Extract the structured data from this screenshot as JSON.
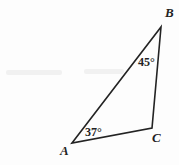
{
  "figure": {
    "type": "geometry-diagram",
    "shape": "triangle",
    "canvas": {
      "width": 179,
      "height": 165
    },
    "background_color": "#fdfdfd",
    "stroke_color": "#232323",
    "stroke_width": 1.6,
    "vertices": [
      {
        "name": "A",
        "label": "A",
        "x": 72,
        "y": 143
      },
      {
        "name": "B",
        "label": "B",
        "x": 161,
        "y": 27
      },
      {
        "name": "C",
        "label": "C",
        "x": 152,
        "y": 128
      }
    ],
    "sides": [
      {
        "name": "AB",
        "from": "A",
        "to": "B"
      },
      {
        "name": "BC",
        "from": "B",
        "to": "C"
      },
      {
        "name": "AC",
        "from": "A",
        "to": "C"
      }
    ],
    "angles": [
      {
        "at": "A",
        "label": "37°",
        "value": 37,
        "unit": "degrees"
      },
      {
        "at": "B",
        "label": "45°",
        "value": 45,
        "unit": "degrees"
      },
      {
        "at": "C",
        "label": "",
        "value": null,
        "unit": "degrees"
      }
    ],
    "polygon_points": "72,143 161,27 152,128"
  },
  "chart_data": {
    "type": "diagram",
    "title": "",
    "categories": [
      "A",
      "B",
      "C"
    ],
    "values": [
      37,
      45,
      98
    ],
    "labels": [
      "37°",
      "45°",
      ""
    ],
    "ylabel": "",
    "xlabel": ""
  }
}
